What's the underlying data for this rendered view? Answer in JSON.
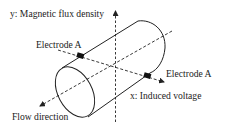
{
  "diagram": {
    "type": "electromagnetic flowmeter schematic",
    "labels": {
      "y_axis": "y: Magnetic flux density",
      "electrode_top": "Electrode A",
      "electrode_right": "Electrode A",
      "x_axis": "x: Induced voltage",
      "flow": "Flow direction"
    },
    "components": [
      {
        "name": "pipe-cylinder",
        "shape": "cylinder"
      },
      {
        "name": "electrode-a-top",
        "shape": "small filled block"
      },
      {
        "name": "electrode-a-right",
        "shape": "small filled block"
      }
    ],
    "axes": [
      {
        "name": "y-axis",
        "meaning": "Magnetic flux density",
        "style": "dashed vertical, arrow up"
      },
      {
        "name": "x-axis",
        "meaning": "Induced voltage",
        "style": "dashed, through electrodes, arrow toward lower right"
      },
      {
        "name": "flow-axis",
        "meaning": "Flow direction",
        "style": "dashed along cylinder axis, arrow toward lower left"
      }
    ],
    "colors": {
      "stroke": "#222222",
      "background": "#ffffff"
    }
  }
}
